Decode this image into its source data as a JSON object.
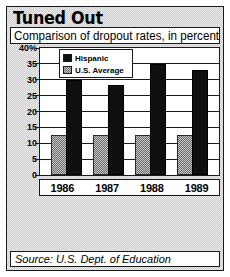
{
  "figure": {
    "title": "Tuned Out",
    "subtitle": "Comparison of dropout rates, in percent",
    "source": "Source: U.S. Dept. of Education"
  },
  "colors": {
    "hispanic": "#101010",
    "us_average": "#9a9a9a",
    "frame": "#1a1a1a",
    "plot_background": "#ffffff",
    "panel_background": "#d8d8d8"
  },
  "legend": {
    "position": "top-center-inside",
    "entries": [
      {
        "label": "Hispanic",
        "swatch": "hispanic-swatch"
      },
      {
        "label": "U.S. Average",
        "swatch": "us-average-swatch"
      }
    ]
  },
  "chart_data": {
    "type": "bar",
    "title": "Tuned Out",
    "subtitle": "Comparison of dropout rates, in percent",
    "xlabel": "",
    "ylabel": "",
    "ylim": [
      0,
      40
    ],
    "yticks": [
      0,
      5,
      10,
      15,
      20,
      25,
      30,
      35,
      40
    ],
    "ytick_labels": [
      "0",
      "5",
      "10",
      "15",
      "20",
      "25",
      "30",
      "35",
      "40%"
    ],
    "grid": true,
    "categories": [
      "1986",
      "1987",
      "1988",
      "1989"
    ],
    "series": [
      {
        "name": "U.S. Average",
        "values": [
          12.5,
          12.5,
          12.5,
          12.5
        ]
      },
      {
        "name": "Hispanic",
        "values": [
          29.8,
          28.5,
          35.0,
          33.0
        ]
      }
    ],
    "source": "Source: U.S. Dept. of Education"
  }
}
